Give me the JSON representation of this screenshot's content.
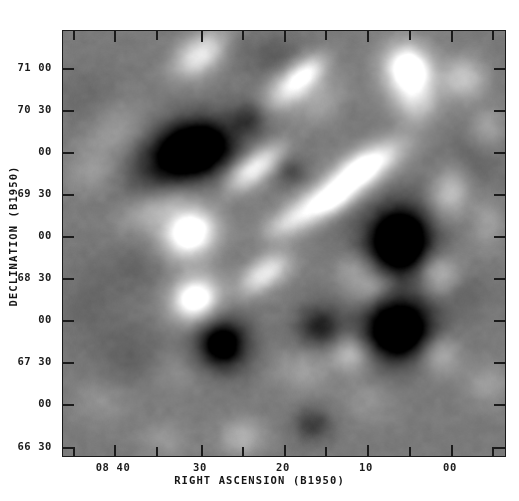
{
  "figure": {
    "type": "astronomical-grayscale-map",
    "background_color": "#ffffff",
    "plot_background_gray": "#8d8d8d",
    "frame_color": "#1a1a1a"
  },
  "axes": {
    "x": {
      "title": "RIGHT ASCENSION (B1950)",
      "major_labels": [
        "08 40",
        "30",
        "20",
        "10",
        "00"
      ],
      "major_positions_px": [
        113,
        200,
        283,
        366,
        450
      ],
      "minor_positions_px": [
        72,
        155,
        241,
        324,
        408,
        491
      ],
      "direction": "decreasing-right"
    },
    "y": {
      "title": "DECLINATION (B1950)",
      "labels": [
        "71 00",
        "70 30",
        "00",
        "69 30",
        "00",
        "68 30",
        "00",
        "67 30",
        "00",
        "66 30"
      ],
      "positions_px": [
        67,
        109,
        151,
        193,
        235,
        277,
        319,
        361,
        403,
        446
      ],
      "direction": "decreasing-down"
    }
  },
  "chart_data": {
    "type": "heatmap",
    "title": "",
    "subtitle": "",
    "xlabel": "RIGHT ASCENSION (B1950)",
    "ylabel": "DECLINATION (B1950)",
    "xlim": [
      "08 45",
      "07 56"
    ],
    "ylim": [
      "+66 20",
      "+71 15"
    ],
    "xtick_labels": [
      "08 40",
      "30",
      "20",
      "10",
      "00"
    ],
    "ytick_labels": [
      "71 00",
      "70 30",
      "00",
      "69 30",
      "00",
      "68 30",
      "00",
      "67 30",
      "00",
      "66 30"
    ],
    "colormap": "grayscale",
    "grid": false,
    "legend": "none",
    "annotations": [],
    "background_level": 0.5,
    "noise_amplitude": 0.02,
    "blobs": [
      {
        "x": 0.285,
        "y": 0.285,
        "amp": -0.6,
        "rx": 0.075,
        "ry": 0.052,
        "rot": -18
      },
      {
        "x": 0.3,
        "y": 0.272,
        "amp": -0.34,
        "rx": 0.048,
        "ry": 0.036,
        "rot": -18
      },
      {
        "x": 0.42,
        "y": 0.205,
        "amp": -0.23,
        "rx": 0.028,
        "ry": 0.026,
        "rot": 0
      },
      {
        "x": 0.515,
        "y": 0.33,
        "amp": -0.18,
        "rx": 0.026,
        "ry": 0.024,
        "rot": 0
      },
      {
        "x": 0.76,
        "y": 0.495,
        "amp": -0.66,
        "rx": 0.055,
        "ry": 0.062,
        "rot": 10
      },
      {
        "x": 0.76,
        "y": 0.49,
        "amp": -0.3,
        "rx": 0.034,
        "ry": 0.038,
        "rot": 10
      },
      {
        "x": 0.76,
        "y": 0.7,
        "amp": -0.64,
        "rx": 0.058,
        "ry": 0.055,
        "rot": -8
      },
      {
        "x": 0.755,
        "y": 0.705,
        "amp": -0.28,
        "rx": 0.035,
        "ry": 0.033,
        "rot": -8
      },
      {
        "x": 0.36,
        "y": 0.735,
        "amp": -0.48,
        "rx": 0.044,
        "ry": 0.046,
        "rot": 0
      },
      {
        "x": 0.358,
        "y": 0.738,
        "amp": -0.22,
        "rx": 0.026,
        "ry": 0.027,
        "rot": 0
      },
      {
        "x": 0.578,
        "y": 0.7,
        "amp": -0.22,
        "rx": 0.032,
        "ry": 0.03,
        "rot": 0
      },
      {
        "x": 0.565,
        "y": 0.925,
        "amp": -0.24,
        "rx": 0.03,
        "ry": 0.028,
        "rot": 0
      },
      {
        "x": 0.585,
        "y": 0.68,
        "amp": -0.14,
        "rx": 0.045,
        "ry": 0.04,
        "rot": 0
      },
      {
        "x": 0.155,
        "y": 0.76,
        "amp": -0.1,
        "rx": 0.06,
        "ry": 0.055,
        "rot": 0
      },
      {
        "x": 0.168,
        "y": 0.55,
        "amp": -0.08,
        "rx": 0.055,
        "ry": 0.048,
        "rot": 0
      },
      {
        "x": 0.055,
        "y": 0.64,
        "amp": -0.07,
        "rx": 0.05,
        "ry": 0.06,
        "rot": 0
      },
      {
        "x": 0.48,
        "y": 0.06,
        "amp": -0.12,
        "rx": 0.05,
        "ry": 0.035,
        "rot": 0
      },
      {
        "x": 0.93,
        "y": 0.3,
        "amp": -0.1,
        "rx": 0.05,
        "ry": 0.055,
        "rot": 0
      },
      {
        "x": 0.905,
        "y": 0.615,
        "amp": -0.09,
        "rx": 0.04,
        "ry": 0.04,
        "rot": 0
      },
      {
        "x": 0.215,
        "y": 0.355,
        "amp": -0.07,
        "rx": 0.06,
        "ry": 0.05,
        "rot": 0
      },
      {
        "x": 0.61,
        "y": 0.42,
        "amp": -0.1,
        "rx": 0.045,
        "ry": 0.038,
        "rot": -35
      },
      {
        "x": 0.048,
        "y": 0.16,
        "amp": -0.06,
        "rx": 0.055,
        "ry": 0.05,
        "rot": 0
      },
      {
        "x": 0.355,
        "y": 0.03,
        "amp": -0.1,
        "rx": 0.04,
        "ry": 0.03,
        "rot": 0
      },
      {
        "x": 0.315,
        "y": 0.05,
        "amp": 0.5,
        "rx": 0.05,
        "ry": 0.03,
        "rot": -40
      },
      {
        "x": 0.282,
        "y": 0.475,
        "amp": 0.55,
        "rx": 0.048,
        "ry": 0.043,
        "rot": -30
      },
      {
        "x": 0.29,
        "y": 0.47,
        "amp": 0.28,
        "rx": 0.028,
        "ry": 0.026,
        "rot": -30
      },
      {
        "x": 0.297,
        "y": 0.63,
        "amp": 0.52,
        "rx": 0.042,
        "ry": 0.038,
        "rot": -30
      },
      {
        "x": 0.3,
        "y": 0.628,
        "amp": 0.26,
        "rx": 0.025,
        "ry": 0.023,
        "rot": -30
      },
      {
        "x": 0.245,
        "y": 0.4,
        "amp": 0.16,
        "rx": 0.06,
        "ry": 0.028,
        "rot": -35
      },
      {
        "x": 0.175,
        "y": 0.425,
        "amp": 0.12,
        "rx": 0.05,
        "ry": 0.028,
        "rot": -35
      },
      {
        "x": 0.415,
        "y": 0.335,
        "amp": 0.4,
        "rx": 0.042,
        "ry": 0.025,
        "rot": -38
      },
      {
        "x": 0.46,
        "y": 0.3,
        "amp": 0.26,
        "rx": 0.04,
        "ry": 0.022,
        "rot": -38
      },
      {
        "x": 0.52,
        "y": 0.125,
        "amp": 0.46,
        "rx": 0.048,
        "ry": 0.028,
        "rot": -42
      },
      {
        "x": 0.555,
        "y": 0.095,
        "amp": 0.28,
        "rx": 0.035,
        "ry": 0.022,
        "rot": -42
      },
      {
        "x": 0.585,
        "y": 0.165,
        "amp": 0.16,
        "rx": 0.045,
        "ry": 0.028,
        "rot": -42
      },
      {
        "x": 0.65,
        "y": 0.345,
        "amp": 0.5,
        "rx": 0.055,
        "ry": 0.03,
        "rot": -38
      },
      {
        "x": 0.68,
        "y": 0.32,
        "amp": 0.3,
        "rx": 0.038,
        "ry": 0.022,
        "rot": -38
      },
      {
        "x": 0.735,
        "y": 0.29,
        "amp": 0.26,
        "rx": 0.048,
        "ry": 0.028,
        "rot": -38
      },
      {
        "x": 0.565,
        "y": 0.415,
        "amp": 0.42,
        "rx": 0.052,
        "ry": 0.028,
        "rot": -30
      },
      {
        "x": 0.61,
        "y": 0.395,
        "amp": 0.3,
        "rx": 0.038,
        "ry": 0.024,
        "rot": -30
      },
      {
        "x": 0.5,
        "y": 0.455,
        "amp": 0.22,
        "rx": 0.04,
        "ry": 0.024,
        "rot": -30
      },
      {
        "x": 0.47,
        "y": 0.56,
        "amp": 0.34,
        "rx": 0.04,
        "ry": 0.026,
        "rot": -35
      },
      {
        "x": 0.43,
        "y": 0.59,
        "amp": 0.2,
        "rx": 0.035,
        "ry": 0.024,
        "rot": -35
      },
      {
        "x": 0.78,
        "y": 0.095,
        "amp": 0.58,
        "rx": 0.04,
        "ry": 0.048,
        "rot": -20
      },
      {
        "x": 0.785,
        "y": 0.09,
        "amp": 0.3,
        "rx": 0.024,
        "ry": 0.028,
        "rot": -20
      },
      {
        "x": 0.8,
        "y": 0.17,
        "amp": 0.22,
        "rx": 0.035,
        "ry": 0.035,
        "rot": 0
      },
      {
        "x": 0.875,
        "y": 0.38,
        "amp": 0.3,
        "rx": 0.03,
        "ry": 0.042,
        "rot": 15
      },
      {
        "x": 0.85,
        "y": 0.57,
        "amp": 0.3,
        "rx": 0.034,
        "ry": 0.034,
        "rot": 0
      },
      {
        "x": 0.7,
        "y": 0.6,
        "amp": 0.26,
        "rx": 0.038,
        "ry": 0.026,
        "rot": -20
      },
      {
        "x": 0.66,
        "y": 0.555,
        "amp": 0.18,
        "rx": 0.034,
        "ry": 0.024,
        "rot": -20
      },
      {
        "x": 0.65,
        "y": 0.76,
        "amp": 0.28,
        "rx": 0.03,
        "ry": 0.03,
        "rot": 0
      },
      {
        "x": 0.85,
        "y": 0.76,
        "amp": 0.26,
        "rx": 0.032,
        "ry": 0.034,
        "rot": 0
      },
      {
        "x": 0.905,
        "y": 0.11,
        "amp": 0.3,
        "rx": 0.035,
        "ry": 0.035,
        "rot": 0
      },
      {
        "x": 0.96,
        "y": 0.23,
        "amp": 0.18,
        "rx": 0.03,
        "ry": 0.035,
        "rot": 0
      },
      {
        "x": 0.405,
        "y": 0.955,
        "amp": 0.22,
        "rx": 0.035,
        "ry": 0.03,
        "rot": 0
      },
      {
        "x": 0.23,
        "y": 0.96,
        "amp": 0.12,
        "rx": 0.04,
        "ry": 0.03,
        "rot": 0
      },
      {
        "x": 0.085,
        "y": 0.87,
        "amp": 0.1,
        "rx": 0.045,
        "ry": 0.035,
        "rot": 0
      },
      {
        "x": 0.12,
        "y": 0.23,
        "amp": 0.14,
        "rx": 0.055,
        "ry": 0.04,
        "rot": -30
      },
      {
        "x": 0.065,
        "y": 0.33,
        "amp": 0.12,
        "rx": 0.045,
        "ry": 0.035,
        "rot": -30
      },
      {
        "x": 0.54,
        "y": 0.8,
        "amp": 0.14,
        "rx": 0.045,
        "ry": 0.035,
        "rot": 0
      },
      {
        "x": 0.96,
        "y": 0.83,
        "amp": 0.14,
        "rx": 0.035,
        "ry": 0.035,
        "rot": 0
      },
      {
        "x": 0.69,
        "y": 0.87,
        "amp": 0.1,
        "rx": 0.04,
        "ry": 0.035,
        "rot": 0
      },
      {
        "x": 0.96,
        "y": 0.45,
        "amp": 0.14,
        "rx": 0.028,
        "ry": 0.045,
        "rot": 0
      },
      {
        "x": 0.25,
        "y": 0.8,
        "amp": 0.08,
        "rx": 0.05,
        "ry": 0.04,
        "rot": 0
      }
    ]
  }
}
